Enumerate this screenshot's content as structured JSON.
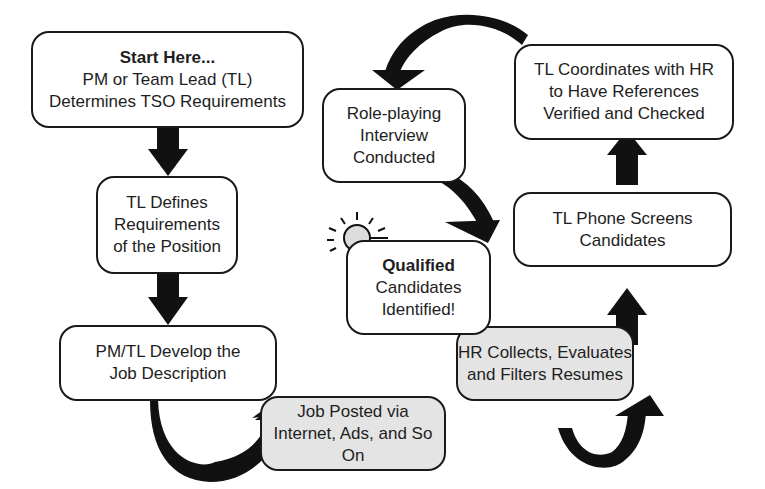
{
  "diagram": {
    "type": "flowchart",
    "colors": {
      "stroke": "#1a1a1a",
      "box_fill": "#ffffff",
      "shaded_fill": "#e4e4e4",
      "arrow": "#111111"
    },
    "nodes": [
      {
        "id": "start",
        "title": "Start Here...",
        "lines": [
          "PM or Team Lead (TL)",
          "Determines TSO Requirements"
        ],
        "shaded": false
      },
      {
        "id": "define",
        "lines": [
          "TL Defines",
          "Requirements",
          "of the Position"
        ],
        "shaded": false
      },
      {
        "id": "develop",
        "lines": [
          "PM/TL Develop the",
          "Job Description"
        ],
        "shaded": false
      },
      {
        "id": "posted",
        "lines": [
          "Job Posted via",
          "Internet, Ads, and So On"
        ],
        "shaded": true
      },
      {
        "id": "hr-collect",
        "lines": [
          "HR Collects, Evaluates",
          "and Filters Resumes"
        ],
        "shaded": true
      },
      {
        "id": "phone",
        "lines": [
          "TL Phone Screens",
          "Candidates"
        ],
        "shaded": false
      },
      {
        "id": "references",
        "lines": [
          "TL Coordinates with HR",
          "to Have References",
          "Verified and Checked"
        ],
        "shaded": false
      },
      {
        "id": "interview",
        "lines": [
          "Role-playing",
          "Interview",
          "Conducted"
        ],
        "shaded": false
      },
      {
        "id": "qualified",
        "title": "Qualified",
        "lines": [
          "Candidates",
          "Identified!"
        ],
        "shaded": false,
        "icon": "lightbulb-icon"
      }
    ],
    "edges": [
      [
        "start",
        "define"
      ],
      [
        "define",
        "develop"
      ],
      [
        "develop",
        "posted"
      ],
      [
        "posted",
        "hr-collect"
      ],
      [
        "hr-collect",
        "phone"
      ],
      [
        "phone",
        "references"
      ],
      [
        "references",
        "interview"
      ],
      [
        "interview",
        "qualified"
      ]
    ]
  }
}
